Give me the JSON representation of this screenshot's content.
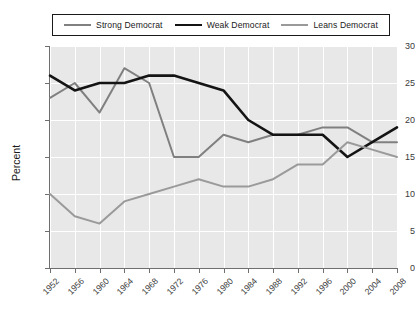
{
  "chart_data": {
    "type": "line",
    "title": "",
    "xlabel": "",
    "ylabel": "Percent",
    "ylim": [
      0,
      30
    ],
    "yticks": [
      0,
      5,
      10,
      15,
      20,
      25,
      30
    ],
    "grid": true,
    "legend_position": "top",
    "categories": [
      "1952",
      "1956",
      "1960",
      "1964",
      "1968",
      "1972",
      "1976",
      "1980",
      "1984",
      "1988",
      "1992",
      "1996",
      "2000",
      "2004",
      "2008"
    ],
    "series": [
      {
        "name": "Strong Democrat",
        "color": "#808080",
        "width": 2.0,
        "values": [
          23,
          25,
          21,
          27,
          25,
          15,
          15,
          18,
          17,
          18,
          18,
          19,
          19,
          17,
          17
        ]
      },
      {
        "name": "Weak Democrat",
        "color": "#141414",
        "width": 2.6,
        "values": [
          26,
          24,
          25,
          25,
          26,
          26,
          25,
          24,
          20,
          18,
          18,
          18,
          15,
          17,
          19
        ]
      },
      {
        "name": "Leans Democrat",
        "color": "#9a9a9a",
        "width": 2.0,
        "values": [
          10,
          7,
          6,
          9,
          10,
          11,
          12,
          11,
          11,
          12,
          14,
          14,
          17,
          16,
          15
        ]
      }
    ]
  },
  "axes": {
    "plot_background": "#e8e8e8",
    "gridline_color": "#ffffff",
    "axis_color": "#6e6e6e"
  }
}
